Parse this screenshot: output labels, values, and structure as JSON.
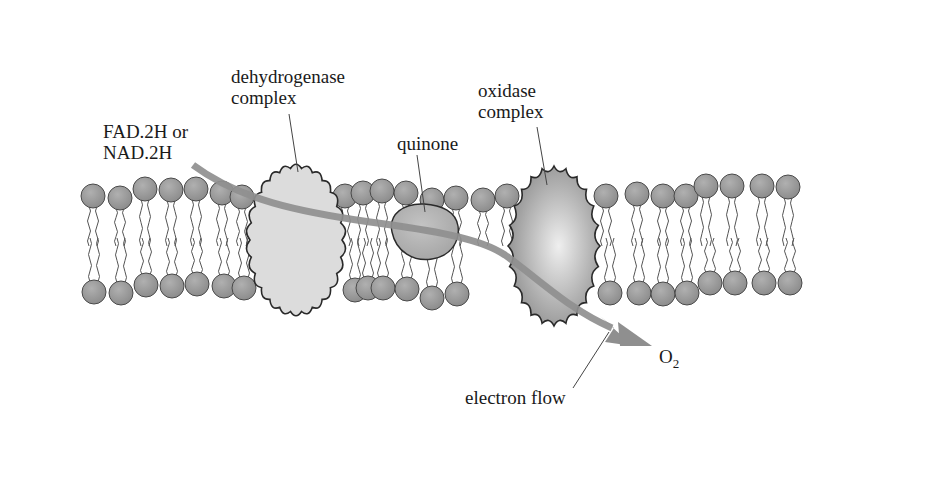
{
  "diagram": {
    "colors": {
      "background": "#ffffff",
      "phospholipid_head": "#9a9a9a",
      "phospholipid_head_stroke": "#4a4a4a",
      "tail_stroke": "#555555",
      "dehydrogenase_fill": "#dcdcdc",
      "quinone_fill": "#b4b4b4",
      "oxidase_fill_center": "#e8e8e8",
      "oxidase_fill_edge": "#8c8c8c",
      "protein_stroke": "#2a2a2a",
      "electron_flow": "#8f8f8f",
      "leader_line": "#444444"
    },
    "labels": {
      "donor": {
        "line1": "FAD.2H or",
        "line2": "NAD.2H"
      },
      "dehydrogenase": {
        "line1": "dehydrogenase",
        "line2": "complex"
      },
      "quinone": {
        "line1": "quinone"
      },
      "oxidase": {
        "line1": "oxidase",
        "line2": "complex"
      },
      "acceptor": {
        "main": "O",
        "subscript": "2"
      },
      "electron_flow": {
        "line1": "electron flow"
      }
    }
  }
}
